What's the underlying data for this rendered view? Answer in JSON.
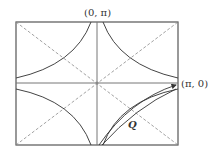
{
  "diagram": {
    "labels": {
      "top": "(0, π)",
      "right": "(π, 0)",
      "vector": "Q"
    },
    "colors": {
      "frame": "#555555",
      "axis": "#777777",
      "diagonal": "#8a8a8a",
      "curve": "#444444",
      "vector": "#333333"
    }
  }
}
